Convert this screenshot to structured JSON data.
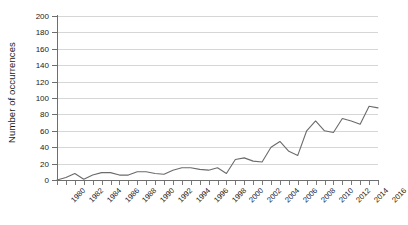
{
  "chart_data": {
    "type": "line",
    "title": "",
    "xlabel": "",
    "ylabel": "Number of occurrences",
    "xlim": [
      1980,
      2016
    ],
    "ylim": [
      0,
      200
    ],
    "ytick_step": 20,
    "xtick_step": 2,
    "grid": true,
    "legend": "none",
    "line_color": "#6b6b6b",
    "x": [
      1980,
      1981,
      1982,
      1983,
      1984,
      1985,
      1986,
      1987,
      1988,
      1989,
      1990,
      1991,
      1992,
      1993,
      1994,
      1995,
      1996,
      1997,
      1998,
      1999,
      2000,
      2001,
      2002,
      2003,
      2004,
      2005,
      2006,
      2007,
      2008,
      2009,
      2010,
      2011,
      2012,
      2013,
      2014,
      2015,
      2016
    ],
    "values": [
      0,
      3,
      7,
      1,
      5,
      9,
      9,
      6,
      6,
      10,
      10,
      8,
      7,
      12,
      15,
      15,
      13,
      12,
      15,
      8,
      22,
      25,
      24,
      21,
      30,
      35,
      30,
      24,
      45,
      56,
      49,
      38,
      58,
      55,
      52,
      60,
      60
    ],
    "ytick_labels": [
      "0",
      "20",
      "40",
      "60",
      "80",
      "100",
      "120",
      "140",
      "160",
      "180",
      "200"
    ],
    "xtick_labels": [
      "1980",
      "1982",
      "1984",
      "1986",
      "1988",
      "1990",
      "1992",
      "1994",
      "1996",
      "1998",
      "2000",
      "2002",
      "2004",
      "2006",
      "2008",
      "2010",
      "2012",
      "2014",
      "2016"
    ],
    "series": [
      {
        "name": "occurrences",
        "values": [
          0,
          3,
          7,
          1,
          5,
          9,
          9,
          6,
          6,
          10,
          10,
          8,
          7,
          12,
          15,
          15,
          13,
          12,
          15,
          8,
          22,
          25,
          24,
          21,
          32,
          45,
          38,
          30,
          52,
          60,
          55,
          48,
          70,
          65,
          60,
          78,
          72
        ]
      }
    ],
    "data_points": [
      {
        "year": 1980,
        "value": 0
      },
      {
        "year": 1981,
        "value": 3
      },
      {
        "year": 1982,
        "value": 8
      },
      {
        "year": 1983,
        "value": 1
      },
      {
        "year": 1984,
        "value": 6
      },
      {
        "year": 1985,
        "value": 9
      },
      {
        "year": 1986,
        "value": 9
      },
      {
        "year": 1987,
        "value": 6
      },
      {
        "year": 1988,
        "value": 6
      },
      {
        "year": 1989,
        "value": 10
      },
      {
        "year": 1990,
        "value": 10
      },
      {
        "year": 1991,
        "value": 8
      },
      {
        "year": 1992,
        "value": 7
      },
      {
        "year": 1993,
        "value": 12
      },
      {
        "year": 1994,
        "value": 15
      },
      {
        "year": 1995,
        "value": 15
      },
      {
        "year": 1996,
        "value": 13
      },
      {
        "year": 1997,
        "value": 12
      },
      {
        "year": 1998,
        "value": 15
      },
      {
        "year": 1999,
        "value": 8
      },
      {
        "year": 2000,
        "value": 25
      },
      {
        "year": 2001,
        "value": 27
      },
      {
        "year": 2002,
        "value": 23
      },
      {
        "year": 2003,
        "value": 22
      },
      {
        "year": 2004,
        "value": 40
      },
      {
        "year": 2005,
        "value": 47
      },
      {
        "year": 2006,
        "value": 35
      },
      {
        "year": 2007,
        "value": 30
      },
      {
        "year": 2008,
        "value": 60
      },
      {
        "year": 2009,
        "value": 72
      },
      {
        "year": 2010,
        "value": 60
      },
      {
        "year": 2011,
        "value": 58
      },
      {
        "year": 2012,
        "value": 75
      },
      {
        "year": 2013,
        "value": 72
      },
      {
        "year": 2014,
        "value": 68
      },
      {
        "year": 2015,
        "value": 90
      },
      {
        "year": 2016,
        "value": 88
      }
    ]
  },
  "axes": {
    "y_title": "Number of occurrences"
  }
}
